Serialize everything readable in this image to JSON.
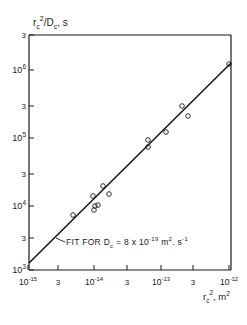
{
  "chart_data": {
    "type": "scatter",
    "title": "",
    "xlabel": "r_c^2, m^2",
    "ylabel": "r_c^2/D_c, s",
    "xscale": "log",
    "yscale": "log",
    "xlim": [
      1e-15,
      1e-12
    ],
    "ylim": [
      1000.0,
      3000000.0
    ],
    "grid": false,
    "x_ticks": [
      "10^-15",
      "3",
      "10^-14",
      "3",
      "10^-13",
      "3",
      "10^-12"
    ],
    "y_ticks": [
      "10^3",
      "3",
      "10^4",
      "3",
      "10^5",
      "3",
      "10^6",
      "3"
    ],
    "series": [
      {
        "name": "measured",
        "marker": "open-circle",
        "points": [
          {
            "x": 4.7e-15,
            "y": 6600.0
          },
          {
            "x": 9.3e-15,
            "y": 12500.0
          },
          {
            "x": 9.6e-15,
            "y": 8400.0
          },
          {
            "x": 9.5e-15,
            "y": 7500.0
          },
          {
            "x": 1.1e-14,
            "y": 8500.0
          },
          {
            "x": 1.3e-14,
            "y": 16000.0
          },
          {
            "x": 1.6e-14,
            "y": 12000.0
          },
          {
            "x": 2.8e-14,
            "y": 50000.0
          },
          {
            "x": 2.8e-14,
            "y": 40000.0
          },
          {
            "x": 5e-14,
            "y": 68000.0
          },
          {
            "x": 1.7e-13,
            "y": 130000.0
          },
          {
            "x": 2.1e-13,
            "y": 95000.0
          },
          {
            "x": 9.8e-13,
            "y": 1500000.0
          }
        ]
      },
      {
        "name": "FIT FOR D_c = 8 x 10^-19 m^2. s^-1",
        "type": "line",
        "points": [
          {
            "x": 1e-15,
            "y": 1250.0
          },
          {
            "x": 1e-12,
            "y": 1250000.0
          }
        ]
      }
    ],
    "annotations": [
      {
        "text": "FIT FOR D_c = 8 x 10^-19 m^2. s^-1",
        "points_to": "fit line near x=3e-15"
      }
    ]
  },
  "labels": {
    "ylabel_main": "r",
    "ylabel_sub": "c",
    "ylabel_sup": "2",
    "ylabel_rest": "/D",
    "ylabel_sub2": "c",
    "ylabel_unit": ", s",
    "xlabel_main": "r",
    "xlabel_sub": "c",
    "xlabel_sup": "2",
    "xlabel_rest": ", m",
    "xlabel_sup2": "2",
    "fit_prefix": "FIT FOR D",
    "fit_sub": "c",
    "fit_eq": " = 8 x 10",
    "fit_exp": "-19",
    "fit_units1": " m",
    "fit_units1_sup": "2",
    "fit_units2": ". s",
    "fit_units2_sup": "-1"
  },
  "axes": {
    "x": [
      {
        "base": "10",
        "exp": "-15",
        "px": 28
      },
      {
        "base": "3",
        "exp": "",
        "px": 58
      },
      {
        "base": "10",
        "exp": "-14",
        "px": 94
      },
      {
        "base": "3",
        "exp": "",
        "px": 127
      },
      {
        "base": "10",
        "exp": "-13",
        "px": 161
      },
      {
        "base": "3",
        "exp": "",
        "px": 193
      },
      {
        "base": "10",
        "exp": "-12",
        "px": 229
      }
    ],
    "y": [
      {
        "base": "10",
        "exp": "3",
        "py": 270
      },
      {
        "base": "3",
        "exp": "",
        "py": 238
      },
      {
        "base": "10",
        "exp": "4",
        "py": 206
      },
      {
        "base": "3",
        "exp": "",
        "py": 174
      },
      {
        "base": "10",
        "exp": "5",
        "py": 138
      },
      {
        "base": "3",
        "exp": "",
        "py": 106
      },
      {
        "base": "10",
        "exp": "6",
        "py": 70
      },
      {
        "base": "3",
        "exp": "",
        "py": 35
      }
    ]
  }
}
